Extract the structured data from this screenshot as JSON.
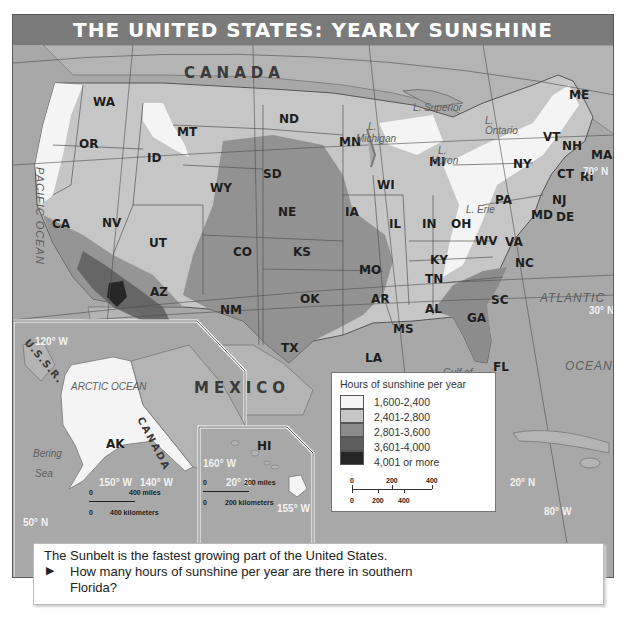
{
  "title": "THE UNITED STATES: YEARLY SUNSHINE",
  "states": [
    {
      "abbr": "WA",
      "x": 80,
      "y": 50
    },
    {
      "abbr": "OR",
      "x": 66,
      "y": 92
    },
    {
      "abbr": "ID",
      "x": 134,
      "y": 106
    },
    {
      "abbr": "MT",
      "x": 164,
      "y": 80
    },
    {
      "abbr": "WY",
      "x": 197,
      "y": 136
    },
    {
      "abbr": "ND",
      "x": 266,
      "y": 67
    },
    {
      "abbr": "SD",
      "x": 250,
      "y": 122
    },
    {
      "abbr": "NE",
      "x": 265,
      "y": 160
    },
    {
      "abbr": "CA",
      "x": 39,
      "y": 172
    },
    {
      "abbr": "NV",
      "x": 89,
      "y": 171
    },
    {
      "abbr": "UT",
      "x": 136,
      "y": 191
    },
    {
      "abbr": "CO",
      "x": 220,
      "y": 200
    },
    {
      "abbr": "KS",
      "x": 280,
      "y": 200
    },
    {
      "abbr": "AZ",
      "x": 137,
      "y": 240
    },
    {
      "abbr": "NM",
      "x": 207,
      "y": 258
    },
    {
      "abbr": "OK",
      "x": 287,
      "y": 247
    },
    {
      "abbr": "TX",
      "x": 268,
      "y": 296
    },
    {
      "abbr": "MN",
      "x": 326,
      "y": 90
    },
    {
      "abbr": "IA",
      "x": 332,
      "y": 160
    },
    {
      "abbr": "MO",
      "x": 346,
      "y": 218
    },
    {
      "abbr": "AR",
      "x": 358,
      "y": 247
    },
    {
      "abbr": "LA",
      "x": 352,
      "y": 306
    },
    {
      "abbr": "WI",
      "x": 364,
      "y": 133
    },
    {
      "abbr": "MI",
      "x": 416,
      "y": 110
    },
    {
      "abbr": "IL",
      "x": 376,
      "y": 172
    },
    {
      "abbr": "IN",
      "x": 409,
      "y": 172
    },
    {
      "abbr": "OH",
      "x": 438,
      "y": 172
    },
    {
      "abbr": "KY",
      "x": 417,
      "y": 208
    },
    {
      "abbr": "TN",
      "x": 412,
      "y": 227
    },
    {
      "abbr": "MS",
      "x": 380,
      "y": 277
    },
    {
      "abbr": "AL",
      "x": 412,
      "y": 257
    },
    {
      "abbr": "GA",
      "x": 454,
      "y": 266
    },
    {
      "abbr": "FL",
      "x": 480,
      "y": 315
    },
    {
      "abbr": "SC",
      "x": 478,
      "y": 248
    },
    {
      "abbr": "NC",
      "x": 502,
      "y": 211
    },
    {
      "abbr": "VA",
      "x": 492,
      "y": 190
    },
    {
      "abbr": "WV",
      "x": 462,
      "y": 189
    },
    {
      "abbr": "PA",
      "x": 482,
      "y": 148
    },
    {
      "abbr": "NY",
      "x": 500,
      "y": 112
    },
    {
      "abbr": "VT",
      "x": 530,
      "y": 85
    },
    {
      "abbr": "NH",
      "x": 549,
      "y": 94
    },
    {
      "abbr": "ME",
      "x": 556,
      "y": 43
    },
    {
      "abbr": "MA",
      "x": 578,
      "y": 103
    },
    {
      "abbr": "CT",
      "x": 544,
      "y": 122
    },
    {
      "abbr": "RI",
      "x": 567,
      "y": 125
    },
    {
      "abbr": "NJ",
      "x": 539,
      "y": 148
    },
    {
      "abbr": "MD",
      "x": 518,
      "y": 163
    },
    {
      "abbr": "DE",
      "x": 543,
      "y": 165
    },
    {
      "abbr": "AK",
      "x": 93,
      "y": 392
    },
    {
      "abbr": "HI",
      "x": 244,
      "y": 394
    }
  ],
  "water_labels": [
    {
      "text": "L. Superior",
      "x": 400,
      "y": 57
    },
    {
      "text": "L.",
      "x": 472,
      "y": 70
    },
    {
      "text": "Ontario",
      "x": 472,
      "y": 80
    },
    {
      "text": "L.",
      "x": 355,
      "y": 76
    },
    {
      "text": "Michigan",
      "x": 343,
      "y": 88
    },
    {
      "text": "L.",
      "x": 425,
      "y": 100
    },
    {
      "text": "Huron",
      "x": 418,
      "y": 110
    },
    {
      "text": "L. Erie",
      "x": 453,
      "y": 159
    },
    {
      "text": "Gulf of",
      "x": 430,
      "y": 322
    },
    {
      "text": "Mexico",
      "x": 436,
      "y": 341
    },
    {
      "text": "Bering",
      "x": 20,
      "y": 403
    },
    {
      "text": "Sea",
      "x": 22,
      "y": 423
    },
    {
      "text": "ARCTIC OCEAN",
      "x": 58,
      "y": 336
    }
  ],
  "oceans": [
    {
      "text": "ATLANTIC",
      "x": 527,
      "y": 246
    },
    {
      "text": "OCEAN",
      "x": 552,
      "y": 314
    }
  ],
  "pacific_label": "PACIFIC OCEAN",
  "countries": [
    {
      "text": "CANADA",
      "x": 171,
      "y": 19
    },
    {
      "text": "MEXICO",
      "x": 181,
      "y": 334
    }
  ],
  "inset_canada": "CANADA",
  "inset_ussr": "U.S.S.R.",
  "coordinates": [
    {
      "text": "70° N",
      "x": 570,
      "y": 121
    },
    {
      "text": "30° N",
      "x": 576,
      "y": 260
    },
    {
      "text": "120° W",
      "x": 22,
      "y": 291
    },
    {
      "text": "90° W",
      "x": 385,
      "y": 344
    },
    {
      "text": "150° W",
      "x": 86,
      "y": 432
    },
    {
      "text": "140° W",
      "x": 127,
      "y": 432
    },
    {
      "text": "50° N",
      "x": 10,
      "y": 472
    },
    {
      "text": "160° W",
      "x": 190,
      "y": 413
    },
    {
      "text": "20° N",
      "x": 213,
      "y": 432
    },
    {
      "text": "155° W",
      "x": 264,
      "y": 458
    },
    {
      "text": "20° N",
      "x": 497,
      "y": 432
    },
    {
      "text": "80° W",
      "x": 531,
      "y": 461
    }
  ],
  "alaska_scale": {
    "top_zero": "0",
    "top_label": "400 miles",
    "bottom_zero": "0",
    "bottom_label": "400 kilometers"
  },
  "hawaii_scale": {
    "top_zero": "0",
    "top_label": "200 miles",
    "bottom_zero": "0",
    "bottom_label": "200 kilometers"
  },
  "legend": {
    "title": "Hours of sunshine per year",
    "items": [
      {
        "label": "1,600-2,400",
        "color": "#f4f4f4"
      },
      {
        "label": "2,401-2,800",
        "color": "#c6c6c6"
      },
      {
        "label": "2,801-3,600",
        "color": "#8c8c8c"
      },
      {
        "label": "3,601-4,000",
        "color": "#5e5e5e"
      },
      {
        "label": "4,001 or more",
        "color": "#262626"
      }
    ],
    "scale_top": [
      "0",
      "200",
      "400"
    ],
    "scale_bottom": [
      "0",
      "200",
      "400"
    ]
  },
  "caption": {
    "statement": "The Sunbelt is the fastest growing part of the United States.",
    "bullet": "▶",
    "question_line1": "How many hours of sunshine per year are there in southern",
    "question_line2": "Florida?"
  }
}
